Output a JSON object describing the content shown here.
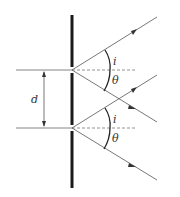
{
  "diagram": {
    "labels": {
      "separation": "d",
      "incident_angle_top": "i",
      "diffraction_angle_top": "θ",
      "incident_angle_bottom": "i",
      "diffraction_angle_bottom": "θ"
    },
    "colors": {
      "screen": "#1a1a1a",
      "ray": "#555555",
      "normal": "#777777",
      "arc": "#222222"
    },
    "elements": [
      "screen-barrier",
      "slit-top",
      "slit-bottom",
      "incident-ray-top",
      "incident-ray-bottom",
      "diffracted-ray-top",
      "diffracted-ray-bottom",
      "normal-top",
      "normal-bottom",
      "separation-arrow"
    ]
  }
}
